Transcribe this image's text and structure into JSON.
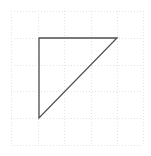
{
  "figure": {
    "title": "",
    "background_color": "#ffffff",
    "width": 151,
    "height": 156
  },
  "grid": {
    "visible": true,
    "style": "dotted",
    "color": "#e3e3e8",
    "line_width": 1,
    "dash_pattern": "1 2",
    "x_lines": [
      11,
      38,
      64,
      91,
      117,
      143
    ],
    "y_lines": [
      11,
      38,
      65,
      91,
      118,
      145
    ],
    "spacing": 26.4
  },
  "shape": {
    "name": "right-triangle",
    "type": "polygon",
    "stroke_color": "#4d4d52",
    "stroke_width": 1.3,
    "fill": "none",
    "closed": true,
    "vertices": [
      {
        "label": "top-left",
        "x": 39,
        "y": 38
      },
      {
        "label": "top-right",
        "x": 117,
        "y": 38
      },
      {
        "label": "bottom-left",
        "x": 39,
        "y": 118
      }
    ],
    "edges": [
      {
        "name": "top-edge",
        "from": "top-left",
        "to": "top-right",
        "orientation": "horizontal",
        "length": 78
      },
      {
        "name": "hypotenuse",
        "from": "top-right",
        "to": "bottom-left",
        "orientation": "diagonal",
        "length": 111.7
      },
      {
        "name": "left-edge",
        "from": "bottom-left",
        "to": "top-left",
        "orientation": "vertical",
        "length": 80
      }
    ],
    "right_angle_at": "top-left"
  }
}
